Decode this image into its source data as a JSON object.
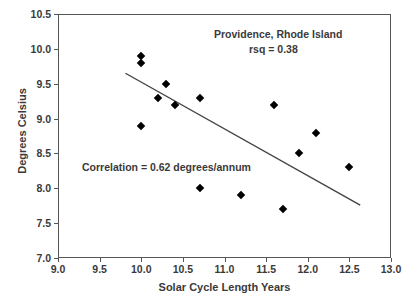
{
  "chart_data": {
    "type": "scatter",
    "title": "",
    "xlabel": "Solar Cycle Length Years",
    "ylabel": "Degrees Celsius",
    "xlim": [
      9.0,
      13.0
    ],
    "ylim": [
      7.0,
      10.5
    ],
    "xticks": [
      "9.0",
      "9.5",
      "10.0",
      "10.5",
      "11.0",
      "11.5",
      "12.0",
      "12.5",
      "13.0"
    ],
    "xtick_values": [
      9.0,
      9.5,
      10.0,
      10.5,
      11.0,
      11.5,
      12.0,
      12.5,
      13.0
    ],
    "yticks": [
      "7.0",
      "7.5",
      "8.0",
      "8.5",
      "9.0",
      "9.5",
      "10.0",
      "10.5"
    ],
    "ytick_values": [
      7.0,
      7.5,
      8.0,
      8.5,
      9.0,
      9.5,
      10.0,
      10.5
    ],
    "grid": false,
    "legend": "none",
    "marker": "diamond",
    "marker_color": "#000000",
    "points": [
      {
        "x": 10.0,
        "y": 9.9
      },
      {
        "x": 10.0,
        "y": 9.8
      },
      {
        "x": 10.0,
        "y": 8.9
      },
      {
        "x": 10.2,
        "y": 9.3
      },
      {
        "x": 10.3,
        "y": 9.5
      },
      {
        "x": 10.4,
        "y": 9.2
      },
      {
        "x": 10.7,
        "y": 9.3
      },
      {
        "x": 10.7,
        "y": 8.0
      },
      {
        "x": 11.2,
        "y": 7.9
      },
      {
        "x": 11.6,
        "y": 9.2
      },
      {
        "x": 11.7,
        "y": 7.7
      },
      {
        "x": 11.9,
        "y": 8.5
      },
      {
        "x": 12.1,
        "y": 8.8
      },
      {
        "x": 12.5,
        "y": 8.3
      }
    ],
    "trendline": {
      "x0": 9.81,
      "y0": 9.65,
      "x1": 12.63,
      "y1": 7.76,
      "color": "#444444"
    },
    "annotations": [
      {
        "name": "location",
        "text": "Providence, Rhode Island"
      },
      {
        "name": "rsq",
        "text": "rsq = 0.38"
      },
      {
        "name": "correlation",
        "text": "Correlation = 0.62 degrees/annum"
      }
    ]
  },
  "axis": {
    "y_title": "Degrees Celsius",
    "x_title": "Solar Cycle Length Years"
  },
  "annotations": {
    "location": "Providence, Rhode Island",
    "rsq": "rsq = 0.38",
    "correlation": "Correlation = 0.62 degrees/annum"
  },
  "colors": {
    "frame": "#555555",
    "text": "#3a3a3a",
    "marker": "#000000",
    "trendline": "#444444",
    "background": "#ffffff"
  }
}
